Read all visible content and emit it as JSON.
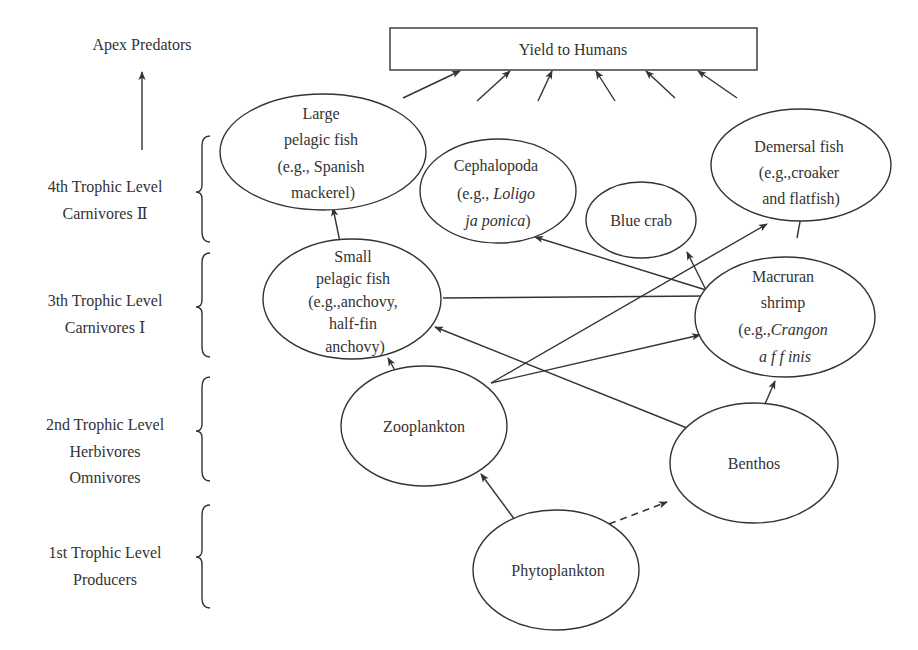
{
  "colors": {
    "ink": "#333333",
    "background": "#ffffff"
  },
  "apex": {
    "label": "Apex Predators"
  },
  "yield": {
    "label": "Yield to Humans"
  },
  "levels": [
    {
      "id": "level-4",
      "lines": [
        "4th Trophic Level",
        "Carnivores Ⅱ"
      ]
    },
    {
      "id": "level-3",
      "lines": [
        "3th Trophic Level",
        "Carnivores Ⅰ"
      ]
    },
    {
      "id": "level-2",
      "lines": [
        "2nd Trophic Level",
        "Herbivores",
        "Omnivores"
      ]
    },
    {
      "id": "level-1",
      "lines": [
        "1st Trophic Level",
        "Producers"
      ]
    }
  ],
  "nodes": [
    {
      "id": "large-pelagic-fish",
      "lines": [
        [
          "Large"
        ],
        [
          "pelagic fish"
        ],
        [
          "(e.g., Spanish"
        ],
        [
          "mackerel)"
        ]
      ]
    },
    {
      "id": "cephalopoda",
      "lines": [
        [
          "Cephalopoda"
        ],
        [
          "(e.g., ",
          "Loligo",
          ""
        ],
        [
          "",
          "ja ponica",
          ")"
        ]
      ]
    },
    {
      "id": "blue-crab",
      "lines": [
        [
          "Blue crab"
        ]
      ]
    },
    {
      "id": "demersal-fish",
      "lines": [
        [
          "Demersal fish"
        ],
        [
          "(e.g.,croaker"
        ],
        [
          "and flatfish)"
        ]
      ]
    },
    {
      "id": "small-pelagic-fish",
      "lines": [
        [
          "Small"
        ],
        [
          "pelagic fish"
        ],
        [
          "(e.g.,anchovy,"
        ],
        [
          "half-fin"
        ],
        [
          "anchovy)"
        ]
      ]
    },
    {
      "id": "macruran-shrimp",
      "lines": [
        [
          "Macruran"
        ],
        [
          "shrimp"
        ],
        [
          "(e.g.,",
          "Crangon",
          ""
        ],
        [
          "",
          "a f f inis",
          ""
        ]
      ]
    },
    {
      "id": "zooplankton",
      "lines": [
        [
          "Zooplankton"
        ]
      ]
    },
    {
      "id": "benthos",
      "lines": [
        [
          "Benthos"
        ]
      ]
    },
    {
      "id": "phytoplankton",
      "lines": [
        [
          "Phytoplankton"
        ]
      ]
    }
  ],
  "edges": [
    {
      "from": "small-pelagic-fish",
      "to": "large-pelagic-fish",
      "style": "solid"
    },
    {
      "from": "zooplankton",
      "to": "small-pelagic-fish",
      "style": "solid"
    },
    {
      "from": "benthos",
      "to": "small-pelagic-fish",
      "style": "solid"
    },
    {
      "from": "macruran-shrimp",
      "to": "small-pelagic-fish",
      "style": "line"
    },
    {
      "from": "macruran-shrimp",
      "to": "cephalopoda",
      "style": "solid"
    },
    {
      "from": "macruran-shrimp",
      "to": "blue-crab",
      "style": "solid"
    },
    {
      "from": "macruran-shrimp",
      "to": "demersal-fish",
      "style": "solid"
    },
    {
      "from": "zooplankton",
      "to": "demersal-fish",
      "style": "solid"
    },
    {
      "from": "zooplankton",
      "to": "macruran-shrimp",
      "style": "solid"
    },
    {
      "from": "benthos",
      "to": "macruran-shrimp",
      "style": "solid"
    },
    {
      "from": "phytoplankton",
      "to": "zooplankton",
      "style": "solid"
    },
    {
      "from": "phytoplankton",
      "to": "benthos",
      "style": "dashed"
    },
    {
      "from": "yield-source",
      "to": "yield-to-humans",
      "style": "solid",
      "count": 6
    },
    {
      "from": "level-4",
      "to": "apex-predators",
      "style": "solid"
    }
  ]
}
